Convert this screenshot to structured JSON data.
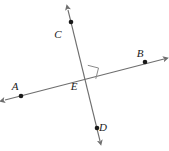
{
  "figure": {
    "type": "geometry-diagram",
    "background_color": "#ffffff",
    "line_color": "#6e6e6e",
    "point_color": "#1a1a1a",
    "label_color": "#1a1a1a",
    "width": 169,
    "height": 151
  },
  "labels": {
    "a": "A",
    "b": "B",
    "c": "C",
    "d": "D",
    "e": "E"
  },
  "points": {
    "a": {
      "x": 21,
      "y": 96
    },
    "b": {
      "x": 145,
      "y": 62
    },
    "c": {
      "x": 71,
      "y": 22
    },
    "d": {
      "x": 97,
      "y": 128
    },
    "e": {
      "x": 85,
      "y": 77
    }
  },
  "label_positions": {
    "a": {
      "x": 15,
      "y": 90
    },
    "b": {
      "x": 140,
      "y": 57
    },
    "c": {
      "x": 58,
      "y": 38
    },
    "d": {
      "x": 103,
      "y": 131
    },
    "e": {
      "x": 74,
      "y": 90
    }
  },
  "lines": [
    {
      "name": "line-AB",
      "through": [
        "A",
        "E",
        "B"
      ],
      "start": {
        "x": 5,
        "y": 100
      },
      "end": {
        "x": 164,
        "y": 59
      },
      "arrows": "both"
    },
    {
      "name": "line-CD",
      "through": [
        "C",
        "E",
        "D"
      ],
      "start": {
        "x": 68,
        "y": 10
      },
      "end": {
        "x": 100,
        "y": 141
      },
      "arrows": "both"
    }
  ],
  "right_angle": {
    "name": "right-angle-marker",
    "vertex": {
      "x": 85,
      "y": 77
    },
    "size": 11,
    "quadrant": "upper-right",
    "measure": "90"
  }
}
